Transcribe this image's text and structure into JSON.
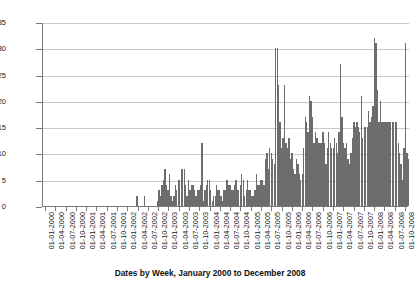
{
  "chart_data": {
    "type": "bar",
    "title": "",
    "xlabel": "Dates by Week, January 2000 to December 2008",
    "ylabel": "",
    "ylim": [
      0,
      35
    ],
    "ytick_values": [
      0,
      5,
      10,
      15,
      20,
      25,
      30,
      35
    ],
    "ytick_labels": [
      "0",
      "5",
      "10",
      "15",
      "20",
      "25",
      "30",
      "35"
    ],
    "grid": true,
    "legend": false,
    "bar_color": "#6d6d6d",
    "x_description": "weekly bins from January 2000 through December 2008",
    "xtick_labels": [
      "01-01-2000",
      "01-04-2000",
      "01-07-2000",
      "01-10-2000",
      "01-01-2001",
      "01-04-2001",
      "01-07-2001",
      "01-10-2001",
      "01-01-2002",
      "01-04-2002",
      "01-07-2002",
      "01-10-2002",
      "01-01-2003",
      "01-04-2003",
      "01-07-2003",
      "01-10-2003",
      "01-01-2004",
      "01-04-2004",
      "01-07-2004",
      "01-10-2004",
      "01-01-2005",
      "01-04-2005",
      "01-07-2005",
      "01-10-2005",
      "01-01-2006",
      "01-04-2006",
      "01-07-2006",
      "01-10-2006",
      "01-01-2007",
      "01-04-2007",
      "01-07-2007",
      "01-10-2007",
      "01-01-2008",
      "01-04-2008",
      "01-07-2008",
      "01-10-2008"
    ],
    "values": [
      0,
      0,
      0,
      0,
      0,
      0,
      0,
      0,
      0,
      0,
      0,
      0,
      0,
      0,
      0,
      0,
      0,
      0,
      0,
      0,
      0,
      0,
      0,
      0,
      0,
      0,
      0,
      0,
      0,
      0,
      0,
      0,
      0,
      0,
      0,
      0,
      0,
      0,
      0,
      0,
      0,
      0,
      0,
      0,
      0,
      0,
      0,
      0,
      0,
      0,
      0,
      0,
      0,
      0,
      0,
      0,
      0,
      0,
      0,
      0,
      0,
      0,
      0,
      2,
      0,
      0,
      0,
      0,
      2,
      0,
      0,
      0,
      0,
      0,
      0,
      0,
      0,
      1,
      3,
      2,
      4,
      5,
      7,
      4,
      3,
      6,
      2,
      1,
      2,
      4,
      3,
      5,
      5,
      7,
      7,
      7,
      4,
      2,
      5,
      3,
      4,
      4,
      3,
      2,
      3,
      3,
      4,
      12,
      1,
      3,
      4,
      5,
      5,
      3,
      1,
      2,
      2,
      4,
      3,
      3,
      2,
      1,
      3,
      3,
      5,
      4,
      4,
      3,
      3,
      4,
      5,
      3,
      3,
      4,
      6,
      5,
      2,
      3,
      5,
      3,
      3,
      2,
      2,
      3,
      6,
      4,
      4,
      5,
      5,
      4,
      9,
      10,
      7,
      11,
      10,
      9,
      8,
      30,
      30,
      23,
      16,
      11,
      13,
      23,
      12,
      11,
      13,
      9,
      10,
      7,
      6,
      9,
      8,
      6,
      5,
      6,
      11,
      17,
      16,
      14,
      21,
      20,
      17,
      12,
      14,
      13,
      12,
      12,
      12,
      14,
      12,
      8,
      11,
      14,
      12,
      11,
      11,
      13,
      12,
      10,
      14,
      27,
      17,
      12,
      11,
      12,
      9,
      8,
      10,
      13,
      16,
      15,
      16,
      15,
      14,
      21,
      13,
      15,
      15,
      15,
      18,
      16,
      17,
      19,
      32,
      31,
      22,
      16,
      20,
      16,
      16,
      16,
      16,
      16,
      16,
      16,
      16,
      16,
      16,
      16,
      12,
      10,
      8,
      5,
      11,
      31,
      10,
      9
    ]
  }
}
